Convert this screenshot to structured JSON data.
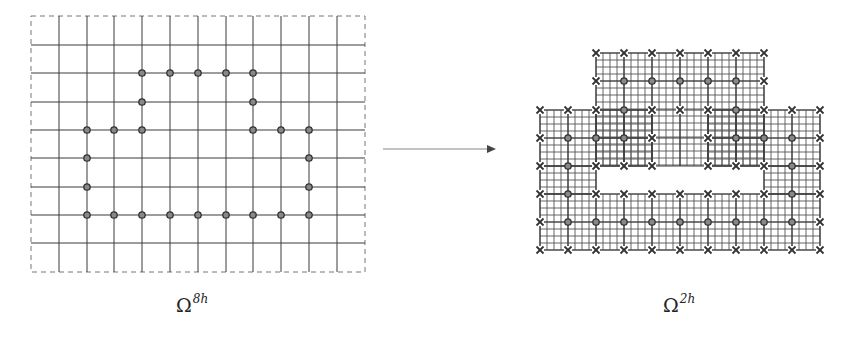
{
  "labels": {
    "left_symbol": "Ω",
    "left_superscript": "8h",
    "right_symbol": "Ω",
    "right_superscript": "2h"
  },
  "colors": {
    "line": "#3a3a3a",
    "fine_line": "#555555",
    "dashed": "#777777",
    "marker": "#333333",
    "circle_fill": "#888888",
    "arrow": "#444444"
  },
  "left_grid": {
    "name": "coarse grid 8h",
    "border": {
      "x": 31,
      "y": 16,
      "w": 334,
      "h": 256
    },
    "vertical_lines_x": [
      59,
      87,
      114,
      142,
      170,
      198,
      226,
      253,
      281,
      309,
      337
    ],
    "horizontal_lines_y": [
      45,
      73,
      102,
      130,
      158,
      187,
      215,
      243
    ],
    "circles": [
      [
        142,
        73
      ],
      [
        170,
        73
      ],
      [
        198,
        73
      ],
      [
        226,
        73
      ],
      [
        253,
        73
      ],
      [
        142,
        102
      ],
      [
        253,
        102
      ],
      [
        87,
        130
      ],
      [
        114,
        130
      ],
      [
        142,
        130
      ],
      [
        253,
        130
      ],
      [
        281,
        130
      ],
      [
        309,
        130
      ],
      [
        87,
        158
      ],
      [
        309,
        158
      ],
      [
        87,
        187
      ],
      [
        309,
        187
      ],
      [
        87,
        215
      ],
      [
        114,
        215
      ],
      [
        142,
        215
      ],
      [
        170,
        215
      ],
      [
        198,
        215
      ],
      [
        226,
        215
      ],
      [
        253,
        215
      ],
      [
        281,
        215
      ],
      [
        309,
        215
      ]
    ]
  },
  "arrow": {
    "x1": 383,
    "y1": 149,
    "x2": 496,
    "y2": 149
  },
  "right_grid": {
    "name": "fine grid 2h",
    "coarse_x": [
      540,
      568,
      596,
      624,
      652,
      680,
      708,
      736,
      764,
      792,
      820
    ],
    "coarse_y": [
      53,
      81,
      110,
      138,
      166,
      194,
      222,
      250
    ],
    "fine_step": 7,
    "patches": [
      {
        "x1": 596,
        "y1": 53,
        "x2": 764,
        "y2": 166
      },
      {
        "x1": 540,
        "y1": 110,
        "x2": 652,
        "y2": 166
      },
      {
        "x1": 708,
        "y1": 110,
        "x2": 820,
        "y2": 166
      },
      {
        "x1": 540,
        "y1": 166,
        "x2": 596,
        "y2": 194
      },
      {
        "x1": 764,
        "y1": 166,
        "x2": 820,
        "y2": 194
      },
      {
        "x1": 540,
        "y1": 194,
        "x2": 820,
        "y2": 250
      }
    ],
    "rows": [
      {
        "y": 53,
        "cells": [
          "",
          "",
          "x",
          "x",
          "x",
          "x",
          "x",
          "x",
          "x",
          "",
          ""
        ]
      },
      {
        "y": 81,
        "cells": [
          "",
          "",
          "x",
          "o",
          "o",
          "o",
          "o",
          "o",
          "x",
          "",
          ""
        ]
      },
      {
        "y": 110,
        "cells": [
          "x",
          "x",
          "x",
          "o",
          "x",
          "x",
          "x",
          "o",
          "x",
          "x",
          "x"
        ]
      },
      {
        "y": 138,
        "cells": [
          "x",
          "o",
          "o",
          "o",
          "x",
          "",
          "x",
          "o",
          "o",
          "o",
          "x"
        ]
      },
      {
        "y": 166,
        "cells": [
          "x",
          "o",
          "x",
          "x",
          "x",
          "",
          "x",
          "x",
          "x",
          "o",
          "x"
        ]
      },
      {
        "y": 194,
        "cells": [
          "x",
          "o",
          "x",
          "x",
          "x",
          "x",
          "x",
          "x",
          "x",
          "o",
          "x"
        ]
      },
      {
        "y": 222,
        "cells": [
          "x",
          "o",
          "o",
          "o",
          "o",
          "o",
          "o",
          "o",
          "o",
          "o",
          "x"
        ]
      },
      {
        "y": 250,
        "cells": [
          "x",
          "x",
          "x",
          "x",
          "x",
          "x",
          "x",
          "x",
          "x",
          "x",
          "x"
        ]
      }
    ]
  }
}
